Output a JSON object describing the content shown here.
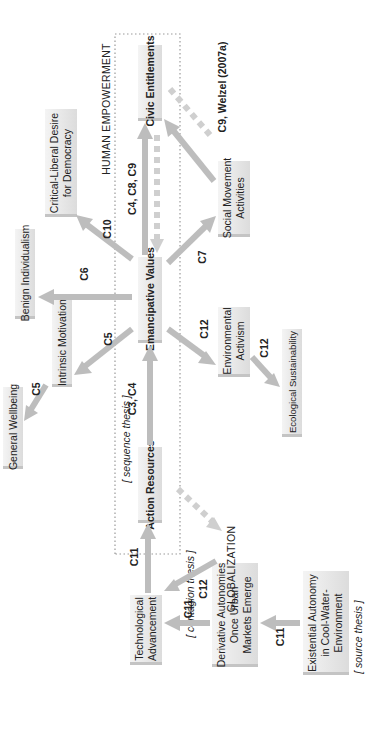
{
  "diagram": {
    "frame_label": "HUMAN  EMPOWERMENT",
    "nodes": {
      "civic_entitlements": "Civic Entitlements",
      "emancipative_values": "Emancipative Values",
      "action_resources": "Action Resources",
      "critical_liberal": [
        "Critical-Liberal Desire",
        "for Democracy"
      ],
      "benign_individualism": "Benign Individualism",
      "intrinsic_motivations": "Intrinsic Motivations",
      "general_wellbeing": "General Wellbeing",
      "social_movement": [
        "Social Movement",
        "Activities"
      ],
      "environmental_activism": [
        "Environmental",
        "Activism"
      ],
      "ecological_sustainability": "Ecological Sustainability",
      "technological_advancement": [
        "Technological",
        "Advancement"
      ],
      "derivative_autonomies": [
        "Derivative Autonomies",
        "Once Urban",
        "Markets Emerge"
      ],
      "existential_autonomy": [
        "Existential Autonomy",
        "in Cool-Water-",
        "Environment"
      ],
      "globalization": "GLOBALIZATION"
    },
    "annotations": {
      "sequence_thesis": "[ sequence thesis ]",
      "contagion_thesis": "[ contagion thesis ]",
      "source_thesis": "[ source thesis ]"
    },
    "edge_labels": {
      "c4_c8_c9": "C4, C8, C9",
      "c9_welzel": "C9, Welzel (2007a)",
      "c10": "C10",
      "c6": "C6",
      "c5_values": "C5",
      "c5_wellbeing": "C5",
      "c3_c4": "C3, C4",
      "c7": "C7",
      "c12_env": "C12",
      "c12_eco": "C12",
      "c11_tech": "C11",
      "c11_deriv": "C11",
      "c12_glob": "C12",
      "c11_exist": "C11"
    },
    "colors": {
      "box_fill": "#e6e6e6",
      "arrow": "#bdbdbd",
      "frame": "#9a9a9a",
      "text": "#222222"
    }
  }
}
